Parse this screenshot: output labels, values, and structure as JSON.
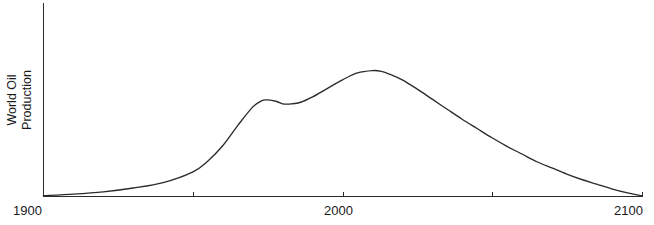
{
  "chart_data": {
    "type": "line",
    "title": "",
    "xlabel": "",
    "ylabel": "World Oil Production",
    "ylabel_lines": [
      "World Oil",
      "Production"
    ],
    "xlim": [
      1900,
      2100
    ],
    "ylim": [
      0,
      1
    ],
    "grid": false,
    "legend": null,
    "axis_color": "#2b2b2b",
    "line_color": "#2b2b2b",
    "x_ticks": [
      {
        "value": 1900,
        "label": "1900",
        "labeled": true
      },
      {
        "value": 1950,
        "label": "",
        "labeled": false
      },
      {
        "value": 2000,
        "label": "2000",
        "labeled": true
      },
      {
        "value": 2050,
        "label": "",
        "labeled": false
      },
      {
        "value": 2100,
        "label": "2100",
        "labeled": true
      }
    ],
    "y_ticks": [],
    "series": [
      {
        "name": "World Oil Production",
        "x": [
          1900,
          1910,
          1920,
          1930,
          1940,
          1950,
          1955,
          1960,
          1965,
          1970,
          1973,
          1975,
          1978,
          1980,
          1983,
          1986,
          1990,
          1995,
          2000,
          2005,
          2010,
          2013,
          2016,
          2020,
          2025,
          2030,
          2035,
          2040,
          2045,
          2050,
          2055,
          2060,
          2065,
          2070,
          2075,
          2080,
          2085,
          2090,
          2095,
          2100
        ],
        "y": [
          0.005,
          0.015,
          0.03,
          0.055,
          0.09,
          0.16,
          0.23,
          0.33,
          0.46,
          0.58,
          0.62,
          0.625,
          0.615,
          0.6,
          0.6,
          0.61,
          0.645,
          0.7,
          0.755,
          0.8,
          0.815,
          0.81,
          0.79,
          0.755,
          0.695,
          0.63,
          0.565,
          0.5,
          0.44,
          0.38,
          0.325,
          0.275,
          0.225,
          0.185,
          0.145,
          0.11,
          0.08,
          0.05,
          0.025,
          0.005
        ]
      }
    ],
    "annotations": []
  },
  "axis_geometry": {
    "x_axis_label_1900": "1900",
    "x_axis_label_2000": "2000",
    "x_axis_label_2100": "2100"
  }
}
